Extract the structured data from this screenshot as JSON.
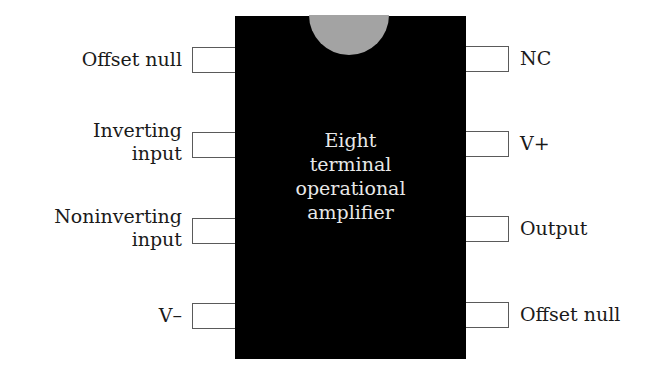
{
  "diagram": {
    "chip": {
      "label_lines": [
        "Eight",
        "terminal",
        "operational",
        "amplifier"
      ],
      "body_color": "#000000",
      "notch_color": "#a3a3a3",
      "text_color": "#e8e8e8"
    },
    "left_pins": [
      {
        "pin": 1,
        "label_lines": [
          "Offset null"
        ]
      },
      {
        "pin": 2,
        "label_lines": [
          "Inverting",
          "input"
        ]
      },
      {
        "pin": 3,
        "label_lines": [
          "Noninverting",
          "input"
        ]
      },
      {
        "pin": 4,
        "label_lines": [
          "V–"
        ]
      }
    ],
    "right_pins": [
      {
        "pin": 8,
        "label_lines": [
          "NC"
        ]
      },
      {
        "pin": 7,
        "label_lines": [
          "V+"
        ]
      },
      {
        "pin": 6,
        "label_lines": [
          "Output"
        ]
      },
      {
        "pin": 5,
        "label_lines": [
          "Offset null"
        ]
      }
    ]
  }
}
